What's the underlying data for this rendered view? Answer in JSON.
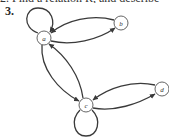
{
  "header": {
    "cut_off_line": "2.   Find a relation R, and describe",
    "item_number": "3."
  },
  "graph": {
    "type": "directed-graph",
    "nodes": [
      {
        "id": "a",
        "label": "a",
        "x": 44,
        "y": 38
      },
      {
        "id": "b",
        "label": "b",
        "x": 121,
        "y": 23
      },
      {
        "id": "c",
        "label": "c",
        "x": 86,
        "y": 105
      },
      {
        "id": "d",
        "label": "d",
        "x": 162,
        "y": 89
      }
    ],
    "edges": [
      {
        "from": "a",
        "to": "a",
        "kind": "loop"
      },
      {
        "from": "b",
        "to": "a"
      },
      {
        "from": "a",
        "to": "b"
      },
      {
        "from": "a",
        "to": "c"
      },
      {
        "from": "c",
        "to": "a"
      },
      {
        "from": "d",
        "to": "c"
      },
      {
        "from": "c",
        "to": "d"
      },
      {
        "from": "c",
        "to": "c",
        "kind": "loop"
      }
    ],
    "colors": {
      "stroke": "#3a3a3a",
      "node_fill": "#ffffff"
    }
  }
}
